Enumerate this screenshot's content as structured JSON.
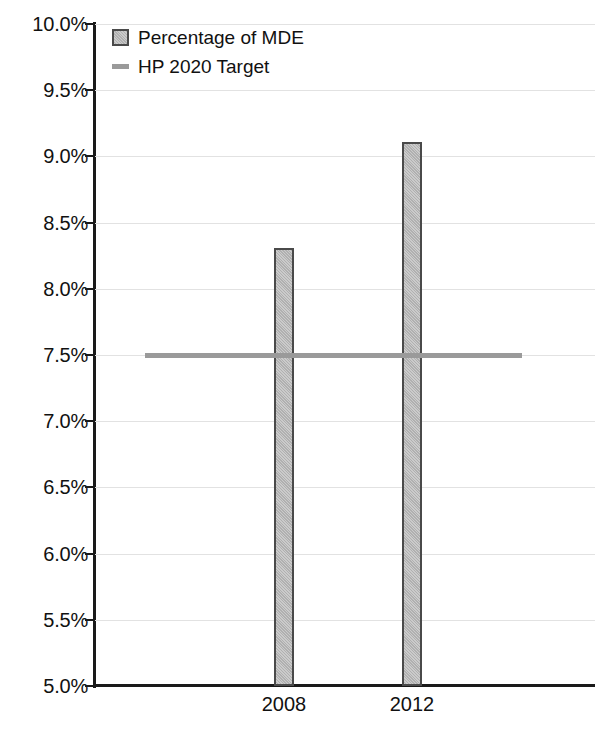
{
  "chart_data": {
    "type": "bar",
    "title": "",
    "xlabel": "",
    "ylabel": "",
    "categories": [
      "2008",
      "2012"
    ],
    "values": [
      8.31,
      9.11
    ],
    "value_labels": [
      "8.31%",
      "9.11%"
    ],
    "ylim": [
      5.0,
      10.0
    ],
    "ytick_step": 0.5,
    "ytick_labels": [
      "10.0%",
      "9.5%",
      "9.0%",
      "8.5%",
      "8.0%",
      "7.5%",
      "7.0%",
      "6.5%",
      "6.0%",
      "5.5%",
      "5.0%"
    ],
    "ytick_values": [
      10.0,
      9.5,
      9.0,
      8.5,
      8.0,
      7.5,
      7.0,
      6.5,
      6.0,
      5.5,
      5.0
    ],
    "grid": true,
    "legend_position": "top-left-inside",
    "series": [
      {
        "name": "Percentage of MDE",
        "type": "bar",
        "color": "#b4b4b4",
        "border_color": "#4a4a4a",
        "values": [
          8.31,
          9.11
        ]
      },
      {
        "name": "HP 2020 Target",
        "type": "line",
        "color": "#9a9a9a",
        "value": 7.5,
        "values": [
          7.5,
          7.5
        ]
      }
    ],
    "annotations": []
  },
  "legend": {
    "items": [
      {
        "label": "Percentage of MDE",
        "marker": "square-swatch"
      },
      {
        "label": "HP 2020 Target",
        "marker": "line-swatch"
      }
    ]
  },
  "axes": {
    "y": {
      "ticks": [
        {
          "label": "10.0%",
          "value": 10.0
        },
        {
          "label": "9.5%",
          "value": 9.5
        },
        {
          "label": "9.0%",
          "value": 9.0
        },
        {
          "label": "8.5%",
          "value": 8.5
        },
        {
          "label": "8.0%",
          "value": 8.0
        },
        {
          "label": "7.5%",
          "value": 7.5
        },
        {
          "label": "7.0%",
          "value": 7.0
        },
        {
          "label": "6.5%",
          "value": 6.5
        },
        {
          "label": "6.0%",
          "value": 6.0
        },
        {
          "label": "5.5%",
          "value": 5.5
        },
        {
          "label": "5.0%",
          "value": 5.0
        }
      ]
    },
    "x": {
      "ticks": [
        {
          "label": "2008"
        },
        {
          "label": "2012"
        }
      ]
    }
  },
  "colors": {
    "bar_fill": "#b4b4b4",
    "bar_border": "#4a4a4a",
    "target_line": "#9a9a9a",
    "axis": "#1a1a1a",
    "gridline": "#e2e2e2",
    "background": "#ffffff",
    "text": "#111111"
  }
}
